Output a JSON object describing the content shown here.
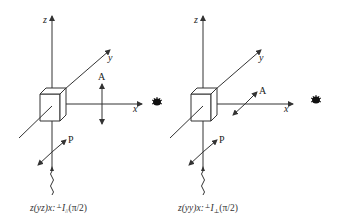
{
  "diagram": {
    "panels": [
      {
        "id": "parallel",
        "axes": {
          "z": "z",
          "y": "y",
          "x": "x"
        },
        "analyzer_label": "A",
        "polarization_label": "P",
        "caption": {
          "notation": "z(yz)x:",
          "intensity": "I",
          "subscript": "//",
          "angle": "(π/2)"
        }
      },
      {
        "id": "perpendicular",
        "axes": {
          "z": "z",
          "y": "y",
          "x": "x"
        },
        "analyzer_label": "A",
        "polarization_label": "P",
        "caption": {
          "notation": "z(yy)x:",
          "intensity": "I",
          "subscript": "⊥",
          "angle": "(π/2)"
        }
      }
    ],
    "icons": [
      "eye-icon",
      "eye-icon"
    ],
    "colors": {
      "line": "#333333",
      "background": "#ffffff"
    }
  }
}
